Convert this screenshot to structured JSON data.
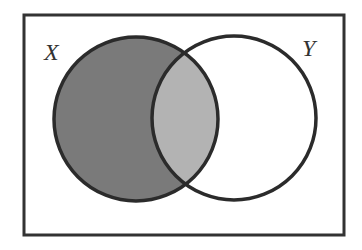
{
  "diagram": {
    "type": "venn",
    "universe": {
      "x": 24,
      "y": 15,
      "width": 320,
      "height": 220,
      "stroke": "#333333"
    },
    "sets": [
      {
        "name": "X",
        "label": "X",
        "cx": 136,
        "cy": 119,
        "r": 82,
        "label_x": 30,
        "label_y": 60
      },
      {
        "name": "Y",
        "label": "Y",
        "cx": 234,
        "cy": 118,
        "r": 82,
        "label_x": 298,
        "label_y": 56
      }
    ],
    "regions": {
      "x_only": {
        "shaded": true,
        "color": "#7a7a7a"
      },
      "x_and_y": {
        "shaded": true,
        "color": "#b3b3b3"
      },
      "y_only": {
        "shaded": false,
        "color": "#ffffff"
      }
    },
    "outline_color": "#2b2b2b"
  }
}
